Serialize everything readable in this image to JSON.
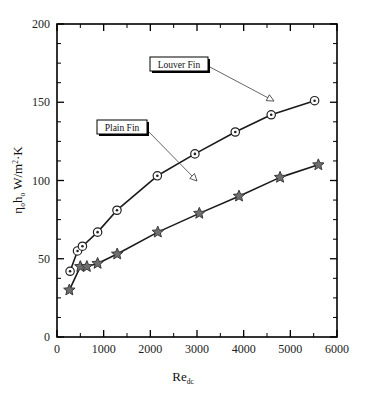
{
  "figure": {
    "background": "#ffffff",
    "frame_color": "#000000"
  },
  "chart_data": {
    "type": "line",
    "title": "",
    "xlabel": "Re_dc",
    "xlabel_base": "Re",
    "xlabel_sub": "dc",
    "ylabel": "ηₒhₒ  W/m²·K",
    "ylabel_parts": {
      "eta": "η",
      "eta_sub": "o",
      "h": "h",
      "h_sub": "o",
      "units": "W/m",
      "units_sup": "2",
      "units_tail": "·K"
    },
    "xlim": [
      0,
      6000
    ],
    "ylim": [
      0,
      200
    ],
    "xticks": [
      0,
      1000,
      2000,
      3000,
      4000,
      5000,
      6000
    ],
    "xtick_labels": [
      "0",
      "1000",
      "2000",
      "3000",
      "4000",
      "5000",
      "6000"
    ],
    "yticks": [
      0,
      50,
      100,
      150,
      200
    ],
    "ytick_labels": [
      "0",
      "50",
      "100",
      "150",
      "200"
    ],
    "x_minor_step": 500,
    "y_minor_step": 12.5,
    "grid": false,
    "legend_position": "inline-annotations",
    "series": [
      {
        "name": "Louver Fin",
        "marker": "circle-dot",
        "marker_fill": "#ffffff",
        "marker_stroke": "#222222",
        "line_color": "#1a1a1a",
        "line_width": 1.6,
        "points": [
          {
            "x": 280,
            "y": 42
          },
          {
            "x": 440,
            "y": 55
          },
          {
            "x": 545,
            "y": 58
          },
          {
            "x": 870,
            "y": 67
          },
          {
            "x": 1285,
            "y": 81
          },
          {
            "x": 2150,
            "y": 103
          },
          {
            "x": 2955,
            "y": 117
          },
          {
            "x": 3820,
            "y": 131
          },
          {
            "x": 4590,
            "y": 142
          },
          {
            "x": 5520,
            "y": 151
          }
        ]
      },
      {
        "name": "Plain Fin",
        "marker": "star",
        "marker_fill": "#6e6e6e",
        "marker_stroke": "#3a3a3a",
        "line_color": "#1a1a1a",
        "line_width": 1.6,
        "points": [
          {
            "x": 265,
            "y": 30
          },
          {
            "x": 500,
            "y": 45
          },
          {
            "x": 640,
            "y": 45
          },
          {
            "x": 870,
            "y": 47
          },
          {
            "x": 1290,
            "y": 53
          },
          {
            "x": 2160,
            "y": 67
          },
          {
            "x": 3050,
            "y": 79
          },
          {
            "x": 3900,
            "y": 90
          },
          {
            "x": 4780,
            "y": 102
          },
          {
            "x": 5600,
            "y": 110
          }
        ]
      }
    ],
    "annotations": [
      {
        "label": "Louver Fin",
        "box_x": 150,
        "box_y": 57,
        "box_w": 58,
        "box_h": 14,
        "leader_from": [
          208,
          66
        ],
        "leader_to": [
          274,
          101
        ],
        "arrow": true
      },
      {
        "label": "Plain Fin",
        "box_x": 97,
        "box_y": 120,
        "box_w": 50,
        "box_h": 14,
        "leader_from": [
          147,
          130
        ],
        "leader_to": [
          197,
          181
        ],
        "arrow": true
      }
    ]
  }
}
